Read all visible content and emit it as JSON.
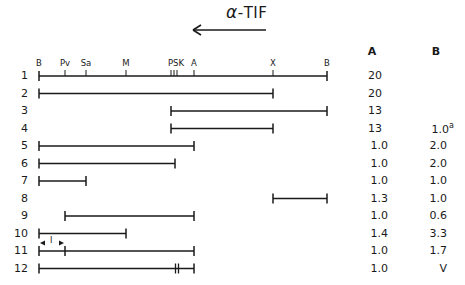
{
  "title": {
    "alpha": "α",
    "text": "-TIF"
  },
  "arrow": {
    "direction": "left",
    "x1": 266,
    "x2": 193,
    "y": 30
  },
  "map": {
    "y": 76,
    "sites": [
      {
        "label": "B",
        "x": 39
      },
      {
        "label": "Pv",
        "x": 65
      },
      {
        "label": "Sa",
        "x": 86
      },
      {
        "label": "M",
        "x": 126
      },
      {
        "label": "PSK",
        "x": 176
      },
      {
        "label": "A",
        "x": 194
      },
      {
        "label": "X",
        "x": 273
      },
      {
        "label": "B",
        "x": 327
      }
    ]
  },
  "columns": {
    "a": "A",
    "b": "B"
  },
  "rows": [
    {
      "n": "1",
      "a": "20",
      "b": ""
    },
    {
      "n": "2",
      "a": "20",
      "b": ""
    },
    {
      "n": "3",
      "a": "13",
      "b": ""
    },
    {
      "n": "4",
      "a": "13",
      "b": "1.0",
      "b_sup": "a"
    },
    {
      "n": "5",
      "a": "1.0",
      "b": "2.0"
    },
    {
      "n": "6",
      "a": "1.0",
      "b": "2.0"
    },
    {
      "n": "7",
      "a": "1.0",
      "b": "1.0"
    },
    {
      "n": "8",
      "a": "1.3",
      "b": "1.0"
    },
    {
      "n": "9",
      "a": "1.0",
      "b": "0.6"
    },
    {
      "n": "10",
      "a": "1.4",
      "b": "3.3"
    },
    {
      "n": "11",
      "a": "1.0",
      "b": "1.7"
    },
    {
      "n": "12",
      "a": "1.0",
      "b": "V"
    }
  ],
  "fragments": [
    {
      "row": 1,
      "x1": 39,
      "x2": 327
    },
    {
      "row": 2,
      "x1": 39,
      "x2": 273
    },
    {
      "row": 3,
      "x1": 171,
      "x2": 327
    },
    {
      "row": 4,
      "x1": 171,
      "x2": 273
    },
    {
      "row": 5,
      "x1": 39,
      "x2": 194
    },
    {
      "row": 6,
      "x1": 39,
      "x2": 175
    },
    {
      "row": 7,
      "x1": 39,
      "x2": 86
    },
    {
      "row": 8,
      "x1": 273,
      "x2": 327
    },
    {
      "row": 9,
      "x1": 65,
      "x2": 194
    },
    {
      "row": 10,
      "x1": 39,
      "x2": 126
    },
    {
      "row": 11,
      "x1": 39,
      "x2": 194,
      "inner_tick": 65,
      "insert_label": "I"
    },
    {
      "row": 12,
      "x1": 39,
      "x2": 194,
      "double_tick": 177
    }
  ]
}
